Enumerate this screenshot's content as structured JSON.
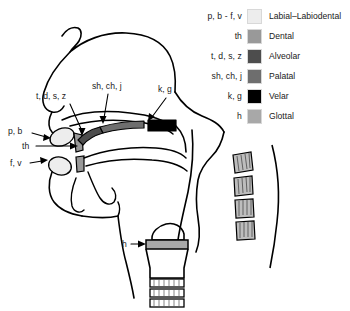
{
  "figure": {
    "background_color": "#ffffff",
    "outline_color": "#000000"
  },
  "legend": {
    "rows": [
      {
        "phonemes": "p, b - f, v",
        "place": "Labial–Labiodental",
        "color": "#ededed"
      },
      {
        "phonemes": "th",
        "place": "Dental",
        "color": "#999999"
      },
      {
        "phonemes": "t, d, s, z",
        "place": "Alveolar",
        "color": "#4d4d4d"
      },
      {
        "phonemes": "sh, ch, j",
        "place": "Palatal",
        "color": "#6e6e6e"
      },
      {
        "phonemes": "k, g",
        "place": "Velar",
        "color": "#000000"
      },
      {
        "phonemes": "h",
        "place": "Glottal",
        "color": "#a8a8a8"
      }
    ]
  },
  "diagram": {
    "labels": [
      {
        "id": "t-d-s-z",
        "text": "t, d, s, z",
        "x": 36,
        "y": 99
      },
      {
        "id": "sh-ch-j",
        "text": "sh, ch, j",
        "x": 92,
        "y": 89
      },
      {
        "id": "k-g",
        "text": "k, g",
        "x": 158,
        "y": 92
      },
      {
        "id": "p-b",
        "text": "p, b",
        "x": 10,
        "y": 131
      },
      {
        "id": "th",
        "text": "th",
        "x": 24,
        "y": 148
      },
      {
        "id": "f-v",
        "text": "f, v",
        "x": 12,
        "y": 165
      },
      {
        "id": "h",
        "text": "h",
        "x": 124,
        "y": 243
      }
    ],
    "regions": {
      "labial_color": "#ededed",
      "dental_color": "#999999",
      "alveolar_color": "#4d4d4d",
      "palatal_color": "#6e6e6e",
      "velar_color": "#000000",
      "glottal_color": "#a8a8a8"
    }
  }
}
